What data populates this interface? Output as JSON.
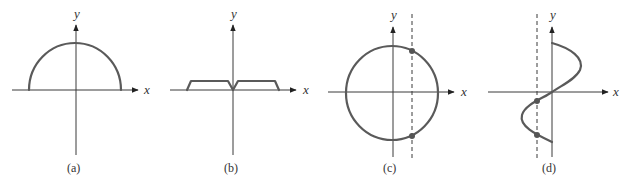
{
  "figure": {
    "panels": [
      {
        "id": "a",
        "caption": "(a)",
        "x_label": "x",
        "y_label": "y",
        "description": "Upper semicircle centered at origin"
      },
      {
        "id": "b",
        "caption": "(b)",
        "x_label": "x",
        "y_label": "y",
        "description": "Two flat-topped trapezoids meeting at a V-dip at the origin"
      },
      {
        "id": "c",
        "caption": "(c)",
        "x_label": "x",
        "y_label": "y",
        "description": "Full circle centered at origin; vertical dashed line intersects circle at two points"
      },
      {
        "id": "d",
        "caption": "(d)",
        "x_label": "x",
        "y_label": "y",
        "description": "S-shaped curve through origin; vertical dashed line intersects curve at two points"
      }
    ]
  }
}
